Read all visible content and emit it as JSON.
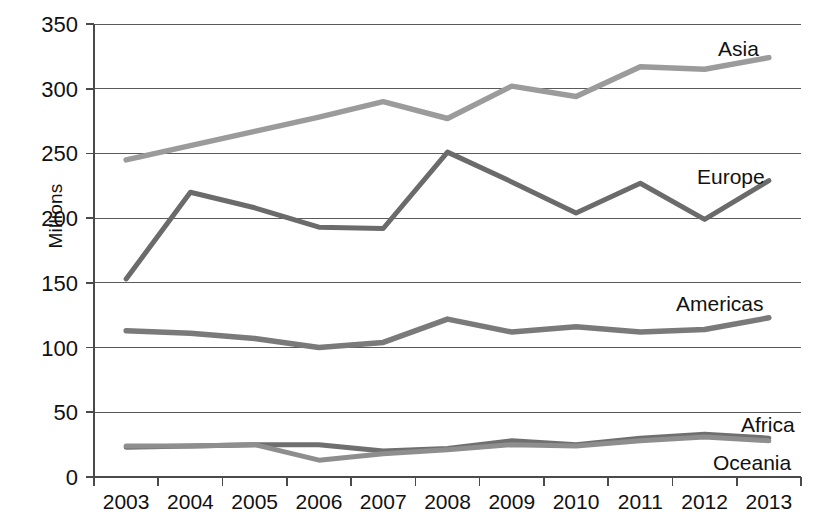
{
  "chart_data": {
    "type": "line",
    "title": "",
    "xlabel": "",
    "ylabel": "Millions",
    "categories": [
      "2003",
      "2004",
      "2005",
      "2006",
      "2007",
      "2008",
      "2009",
      "2010",
      "2011",
      "2012",
      "2013"
    ],
    "x": [
      2003,
      2004,
      2005,
      2006,
      2007,
      2008,
      2009,
      2010,
      2011,
      2012,
      2013
    ],
    "ylim": [
      0,
      350
    ],
    "yticks": [
      0,
      50,
      100,
      150,
      200,
      250,
      300,
      350
    ],
    "ytick_labels": [
      "0",
      "50",
      "100",
      "150",
      "200",
      "250",
      "300",
      "350"
    ],
    "grid": true,
    "legend_position": "inline-right-of-series",
    "series": [
      {
        "name": "Asia",
        "color": "#9b9b9b",
        "values": [
          245,
          256,
          267,
          278,
          290,
          277,
          302,
          294,
          317,
          315,
          324
        ]
      },
      {
        "name": "Europe",
        "color": "#6b6b6b",
        "values": [
          153,
          220,
          208,
          193,
          192,
          251,
          228,
          204,
          227,
          199,
          229
        ]
      },
      {
        "name": "Americas",
        "color": "#7a7a7a",
        "values": [
          113,
          111,
          107,
          100,
          104,
          122,
          112,
          116,
          112,
          114,
          123
        ]
      },
      {
        "name": "Africa",
        "color": "#6f6f6f",
        "values": [
          23,
          24,
          25,
          25,
          20,
          22,
          28,
          25,
          30,
          33,
          30
        ]
      },
      {
        "name": "Oceania",
        "color": "#8e8e8e",
        "values": [
          24,
          24,
          25,
          13,
          18,
          21,
          25,
          24,
          28,
          31,
          28
        ]
      }
    ],
    "series_labels": [
      {
        "name": "Asia",
        "text": "Asia"
      },
      {
        "name": "Europe",
        "text": "Europe"
      },
      {
        "name": "Americas",
        "text": "Americas"
      },
      {
        "name": "Africa",
        "text": "Africa"
      },
      {
        "name": "Oceania",
        "text": "Oceania"
      }
    ]
  }
}
